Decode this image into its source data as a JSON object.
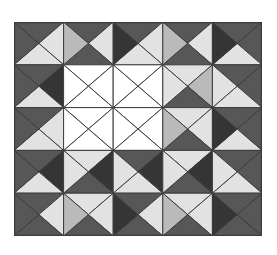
{
  "figure": {
    "rows": 5,
    "cols": 5,
    "palette": {
      "D": "#575757",
      "K": "#353535",
      "L": "#e2e2e2",
      "M": "#bababa",
      "W": "#ffffff"
    },
    "line_color": "#3c3c3c",
    "cells": [
      [
        [
          "D",
          "L",
          "L",
          "D"
        ],
        [
          "D",
          "L",
          "D",
          "M"
        ],
        [
          "D",
          "L",
          "L",
          "K"
        ],
        [
          "D",
          "L",
          "D",
          "M"
        ],
        [
          "D",
          "D",
          "L",
          "K"
        ]
      ],
      [
        [
          "D",
          "K",
          "L",
          "D"
        ],
        [
          "W",
          "W",
          "W",
          "W"
        ],
        [
          "W",
          "W",
          "W",
          "W"
        ],
        [
          "L",
          "M",
          "D",
          "L"
        ],
        [
          "D",
          "D",
          "L",
          "L"
        ]
      ],
      [
        [
          "D",
          "L",
          "L",
          "D"
        ],
        [
          "W",
          "W",
          "W",
          "W"
        ],
        [
          "W",
          "W",
          "W",
          "W"
        ],
        [
          "L",
          "L",
          "D",
          "M"
        ],
        [
          "D",
          "D",
          "L",
          "K"
        ]
      ],
      [
        [
          "D",
          "K",
          "L",
          "D"
        ],
        [
          "L",
          "K",
          "D",
          "L"
        ],
        [
          "D",
          "K",
          "L",
          "L"
        ],
        [
          "L",
          "K",
          "D",
          "L"
        ],
        [
          "D",
          "D",
          "L",
          "L"
        ]
      ],
      [
        [
          "D",
          "L",
          "D",
          "D"
        ],
        [
          "L",
          "L",
          "D",
          "M"
        ],
        [
          "D",
          "L",
          "D",
          "K"
        ],
        [
          "L",
          "L",
          "D",
          "M"
        ],
        [
          "D",
          "D",
          "D",
          "K"
        ]
      ]
    ]
  }
}
